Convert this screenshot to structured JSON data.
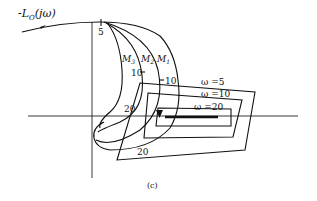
{
  "figure": {
    "caption": "(c)",
    "curve_label": "-L",
    "curve_label_sub": "O",
    "curve_label_arg": "(jω)",
    "contours": [
      {
        "label": "M",
        "sub": "3"
      },
      {
        "label": "M",
        "sub": "2"
      },
      {
        "label": "M",
        "sub": "1"
      }
    ],
    "frequency_marks": {
      "top": "5",
      "m3_10": "10",
      "m1_10": "10",
      "left_20": "20",
      "bottom_20": "20"
    },
    "boxes": [
      {
        "label": "ω =5"
      },
      {
        "label": "ω =10"
      },
      {
        "label": "ω =20"
      }
    ],
    "colors": {
      "ink": "#111111",
      "background": "#ffffff"
    }
  }
}
